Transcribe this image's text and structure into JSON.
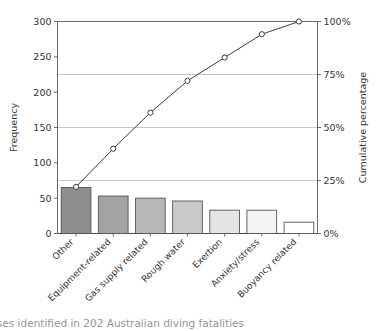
{
  "caption": {
    "text": "causes identified in 202 Australian diving fatalities"
  },
  "chart_data": {
    "type": "bar",
    "title": "",
    "subtitle": "",
    "categories": [
      "Other",
      "Equipment-related",
      "Gas supply related",
      "Rough water",
      "Exertion",
      "Anxiety/stress",
      "Buoyancy related"
    ],
    "values": [
      65,
      53,
      50,
      46,
      33,
      33,
      16
    ],
    "series": [
      {
        "name": "Frequency",
        "type": "bar",
        "values": [
          65,
          53,
          50,
          46,
          33,
          33,
          16
        ]
      },
      {
        "name": "Cumulative percentage",
        "type": "line",
        "values": [
          22,
          40,
          57,
          72,
          83,
          94,
          100
        ]
      }
    ],
    "xlabel": "",
    "ylabel": "Frequency",
    "y2label": "Cumulative percentage",
    "ylim": [
      0,
      300
    ],
    "y2lim": [
      0,
      100
    ],
    "yticks": [
      "0",
      "50",
      "100",
      "150",
      "200",
      "250",
      "300"
    ],
    "ytick_values": [
      0,
      50,
      100,
      150,
      200,
      250,
      300
    ],
    "y2ticks": [
      "0%",
      "25%",
      "50%",
      "75%",
      "100%"
    ],
    "y2tick_values": [
      0,
      25,
      50,
      75,
      100
    ],
    "grid": true,
    "gridlines_at_percent": [
      25,
      50,
      75,
      100
    ],
    "legend": "none",
    "bar_colors": [
      "#8d8d8d",
      "#a3a3a3",
      "#b8b8b8",
      "#cacaca",
      "#e4e4e4",
      "#f4f4f4",
      "#ffffff"
    ],
    "bar_edge_color": "#555555",
    "line_color": "#3c3c3c",
    "marker": "open-circle",
    "marker_face_color": "#ffffff"
  }
}
